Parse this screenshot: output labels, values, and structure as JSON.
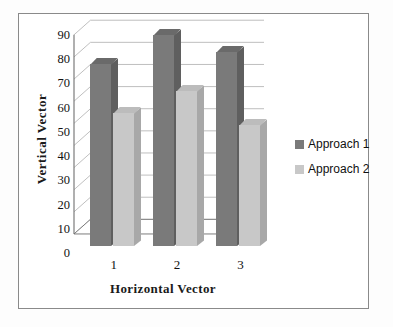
{
  "chart_data": {
    "type": "bar",
    "title": "",
    "xlabel": "Horizontal Vector",
    "ylabel": "Vertical Vector",
    "categories": [
      "1",
      "2",
      "3"
    ],
    "series": [
      {
        "name": "Approach 1",
        "values": [
          75,
          87,
          80
        ],
        "color": "#7a7a7a"
      },
      {
        "name": "Approach 2",
        "values": [
          55,
          64,
          50
        ],
        "color": "#c8c8c8"
      }
    ],
    "ylim": [
      0,
      90
    ],
    "ytick_step": 10,
    "yticks": [
      0,
      10,
      20,
      30,
      40,
      50,
      60,
      70,
      80,
      90
    ],
    "ytick_labels": [
      "0",
      "10",
      "20",
      "30",
      "40",
      "50",
      "60",
      "70",
      "80",
      "90"
    ],
    "grid": true,
    "grid_axis": "y",
    "legend_position": "right",
    "style": "3d-clustered-column"
  },
  "legend": {
    "entries": [
      {
        "label": "Approach 1",
        "color": "#7a7a7a"
      },
      {
        "label": "Approach 2",
        "color": "#c8c8c8"
      }
    ]
  },
  "colors": {
    "series_1": "#7a7a7a",
    "series_2": "#c8c8c8",
    "grid": "#b9b9b9",
    "axis": "#6f6f6f",
    "frame": "#8a8a8a",
    "text": "#111111"
  }
}
